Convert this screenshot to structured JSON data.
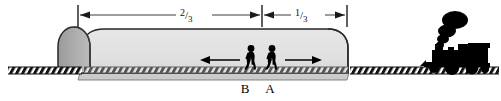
{
  "figure": {
    "background_color": "#ffffff",
    "width": 501,
    "height": 101
  },
  "dimensions": {
    "left_segment": {
      "label_numerator": "2",
      "label_slash": "/",
      "label_denominator": "3",
      "label_full": "2/3",
      "arrow_style": "double-ended"
    },
    "right_segment": {
      "label_numerator": "1",
      "label_slash": "/",
      "label_denominator": "3",
      "label_full": "1/3",
      "arrow_style": "double-ended"
    }
  },
  "tunnel": {
    "body_fill": "#e3e3e3",
    "arch_fill": "#a8a8a8",
    "outline_color": "#2b2b2b",
    "shadow_fill": "#cfcfcf"
  },
  "track": {
    "color": "#1a1a1a",
    "tie_pattern": "diagonal-hatch"
  },
  "walkers": [
    {
      "id": "walker-b",
      "label": "B",
      "direction_arrow": "left",
      "fill": "#000000"
    },
    {
      "id": "walker-a",
      "label": "A",
      "direction_arrow": "right",
      "fill": "#000000"
    }
  ],
  "arrows": {
    "left_motion": "←",
    "right_motion": "→"
  },
  "train": {
    "name": "steam-locomotive",
    "fill": "#000000",
    "smoke_puffs": 4
  }
}
